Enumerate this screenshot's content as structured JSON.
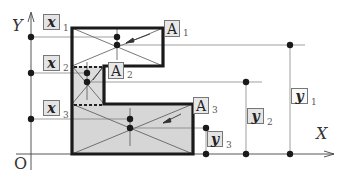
{
  "axes": {
    "x_label": "X",
    "y_label": "Y",
    "origin_label": "O"
  },
  "pieces": [
    {
      "id": 1,
      "area_label": "A",
      "area_sub": "1",
      "x_label": "x",
      "x_sub": "1",
      "y_label": "y",
      "y_sub": "1"
    },
    {
      "id": 2,
      "area_label": "A",
      "area_sub": "2",
      "x_label": "x",
      "x_sub": "2",
      "y_label": "y",
      "y_sub": "2"
    },
    {
      "id": 3,
      "area_label": "A",
      "area_sub": "3",
      "x_label": "x",
      "x_sub": "3",
      "y_label": "y",
      "y_sub": "3"
    }
  ],
  "colors": {
    "outline": "#1a1a1a",
    "fill": "#d9d9d9",
    "line": "#666666"
  }
}
